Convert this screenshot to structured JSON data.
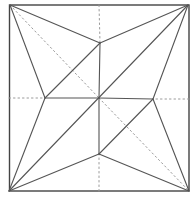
{
  "diagram": {
    "type": "origami-crease-pattern",
    "colors": {
      "mountain": "#555555",
      "valley": "#9a9a9a",
      "border": "#444444",
      "background": "#ffffff"
    },
    "points": {
      "TL": [
        10,
        5
      ],
      "TR": [
        188,
        5
      ],
      "BR": [
        189,
        191
      ],
      "BL": [
        9,
        191
      ],
      "C": [
        99,
        98
      ],
      "T": [
        100,
        43
      ],
      "L": [
        45,
        98
      ],
      "R": [
        153,
        99
      ],
      "B": [
        99,
        154
      ],
      "Tedge": [
        99,
        5
      ],
      "Ledge": [
        9,
        98
      ],
      "Redge": [
        189,
        99
      ],
      "Bedge": [
        99,
        191
      ]
    },
    "mountain_lines": [
      [
        "TL",
        "T"
      ],
      [
        "TL",
        "L"
      ],
      [
        "TR",
        "T"
      ],
      [
        "TR",
        "R"
      ],
      [
        "BL",
        "L"
      ],
      [
        "BL",
        "B"
      ],
      [
        "BR",
        "R"
      ],
      [
        "BR",
        "B"
      ],
      [
        "T",
        "C"
      ],
      [
        "L",
        "C"
      ],
      [
        "R",
        "C"
      ],
      [
        "B",
        "C"
      ],
      [
        "T",
        "L"
      ],
      [
        "R",
        "B"
      ],
      [
        "BL",
        "TR"
      ]
    ],
    "valley_lines": [
      [
        "Tedge",
        "T"
      ],
      [
        "Ledge",
        "L"
      ],
      [
        "Redge",
        "R"
      ],
      [
        "Bedge",
        "B"
      ],
      [
        "TL",
        "C"
      ],
      [
        "C",
        "BR"
      ]
    ]
  }
}
